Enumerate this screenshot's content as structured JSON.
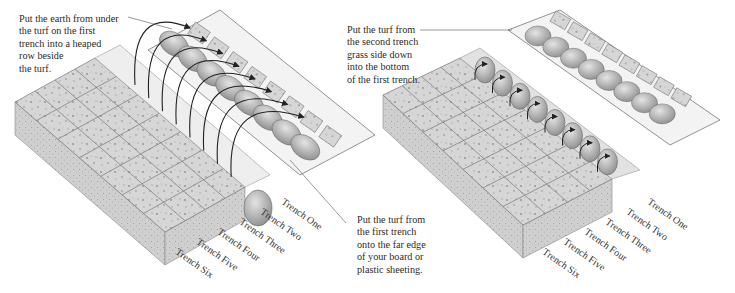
{
  "left_panel": {
    "caption_top": "Put the earth from under\nthe turf on the first\ntrench into a heaped\nrow beside\nthe turf.",
    "caption_bottom": "Put the turf from\nthe first trench\nonto the far edge\nof your board or\nplastic sheeting.",
    "trench_labels": [
      "Trench One",
      "Trench Two",
      "Trench Three",
      "Trench Four",
      "Trench Five",
      "Trench Six"
    ]
  },
  "right_panel": {
    "caption_top": "Put the turf from\nthe second trench\ngrass side down\ninto the bottom\nof the first trench.",
    "trench_labels": [
      "Trench One",
      "Trench Two",
      "Trench Three",
      "Trench Four",
      "Trench Five",
      "Trench Six"
    ]
  },
  "colors": {
    "turf_top": "#d9d9d9",
    "turf_side": "#c4c4c4",
    "soil": "#bdbdbd",
    "board": "#f2f2f2",
    "arrow": "#333333",
    "grid_line": "#7a7a7a"
  }
}
